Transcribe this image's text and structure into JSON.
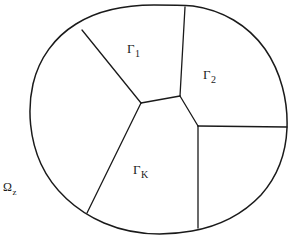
{
  "figure": {
    "name": "partitioned-domain-diagram",
    "stroke_color": "#1a1a1a",
    "fill_color": "#ffffff",
    "background_color": "#ffffff",
    "width": 291,
    "height": 238
  },
  "labels": {
    "gamma_1": {
      "base": "Γ",
      "sub": "1"
    },
    "gamma_2": {
      "base": "Γ",
      "sub": "2"
    },
    "gamma_k": {
      "base": "Γ",
      "sub": "K"
    },
    "omega_z": {
      "base": "Ω",
      "sub": "z"
    }
  },
  "geometry": {
    "outer_boundary": "M 154 5 C 120 5 95 12 76 24 C 55 37 39 58 33 84 C 27 110 30 140 41 164 C 53 190 76 211 104 223 C 132 235 164 236 192 231 C 220 226 244 213 261 195 C 277 177 286 153 287 128 C 288 101 281 72 265 49 C 248 25 222 10 193 6 C 180 5 166 5 154 5 Z",
    "internal_edges": [
      {
        "name": "edge-top-vertical",
        "path": "M 185 7 L 180 96"
      },
      {
        "name": "edge-upper-left",
        "path": "M 82 30 L 141 103"
      },
      {
        "name": "edge-center-top",
        "path": "M 141 103 L 180 96"
      },
      {
        "name": "edge-center-right",
        "path": "M 180 96 L 198 126"
      },
      {
        "name": "edge-right-horizontal",
        "path": "M 198 126 L 287 127"
      },
      {
        "name": "edge-center-bottom-left",
        "path": "M 141 103 L 87 213"
      },
      {
        "name": "edge-bottom-vertical",
        "path": "M 198 126 L 198 228"
      }
    ]
  }
}
